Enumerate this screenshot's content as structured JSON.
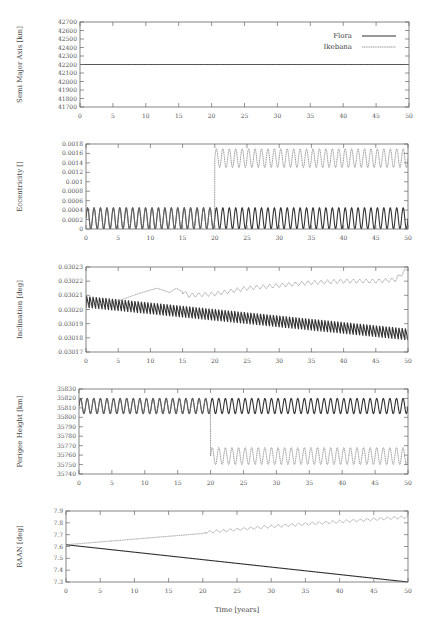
{
  "colors": {
    "flora": "#333333",
    "ikebana": "#888888",
    "axis": "#666666"
  },
  "legend": {
    "flora": "Flora",
    "ikebana": "Ikebana"
  },
  "chart_data": [
    {
      "type": "line",
      "id": "sma",
      "ylabel": "Semi Major Axis [km]",
      "xlabel": "",
      "xlim": [
        0,
        50
      ],
      "ylim": [
        41700,
        42700
      ],
      "xticks": [
        0,
        5,
        10,
        15,
        20,
        25,
        30,
        35,
        40,
        45,
        50
      ],
      "yticks": [
        41700,
        41800,
        41900,
        42000,
        42100,
        42200,
        42300,
        42400,
        42500,
        42600,
        42700
      ],
      "ytick_labels": [
        "41700",
        "41800",
        "41900",
        "42000",
        "42100",
        "42200",
        "42300",
        "42400",
        "42500",
        "42600",
        "42700"
      ],
      "legend_position": "upper right",
      "box": {
        "x0": 80,
        "x1": 409,
        "y0": 22,
        "y1": 107
      },
      "series": [
        {
          "name": "Flora",
          "style": "solid",
          "model": {
            "kind": "const",
            "value": 42200
          }
        },
        {
          "name": "Ikebana",
          "style": "dotted",
          "model": {
            "kind": "const",
            "value": 42200
          }
        }
      ]
    },
    {
      "type": "line",
      "id": "ecc",
      "ylabel": "Eccentricity []",
      "xlabel": "",
      "xlim": [
        0,
        50
      ],
      "ylim": [
        0,
        0.0018
      ],
      "xticks": [
        0,
        5,
        10,
        15,
        20,
        25,
        30,
        35,
        40,
        45,
        50
      ],
      "yticks": [
        0,
        0.0002,
        0.0004,
        0.0006,
        0.0008,
        0.001,
        0.0012,
        0.0014,
        0.0016,
        0.0018
      ],
      "ytick_labels": [
        "0",
        "0.0002",
        "0.0004",
        "0.0006",
        "0.0008",
        "0.001",
        "0.0012",
        "0.0014",
        "0.0016",
        "0.0018"
      ],
      "box": {
        "x0": 86,
        "x1": 408,
        "y0": 144,
        "y1": 229
      },
      "series": [
        {
          "name": "Flora",
          "style": "solid",
          "model": {
            "kind": "osc",
            "base": 0.000225,
            "amp": 0.000225,
            "period": 1.0,
            "trend": 0
          }
        },
        {
          "name": "Ikebana",
          "style": "dotted",
          "model": {
            "kind": "osc_step",
            "t_step": 20,
            "before": {
              "base": 0.000225,
              "amp": 0.000225
            },
            "after": {
              "base": 0.0015,
              "amp": 0.0002
            },
            "period": 1.0
          }
        }
      ]
    },
    {
      "type": "line",
      "id": "inc",
      "ylabel": "Inclination [deg]",
      "xlabel": "",
      "xlim": [
        0,
        50
      ],
      "ylim": [
        0.03017,
        0.03023
      ],
      "xticks": [
        0,
        5,
        10,
        15,
        20,
        25,
        30,
        35,
        40,
        45,
        50
      ],
      "yticks": [
        0.03017,
        0.03018,
        0.03019,
        0.0302,
        0.03021,
        0.03022,
        0.03023
      ],
      "ytick_labels": [
        "0.03017",
        "0.03018",
        "0.03019",
        "0.03020",
        "0.03021",
        "0.03022",
        "0.03023"
      ],
      "box": {
        "x0": 86,
        "x1": 408,
        "y0": 267,
        "y1": 352
      },
      "series": [
        {
          "name": "Flora",
          "style": "solid",
          "model": {
            "kind": "saw",
            "start": 0.030203,
            "end": 0.03018,
            "amp": 8.5e-06,
            "period": 0.5
          }
        },
        {
          "name": "Ikebana",
          "style": "dotted",
          "points": [
            [
              0,
              0.030203
            ],
            [
              5,
              0.030206
            ],
            [
              8,
              0.030211
            ],
            [
              11,
              0.030215
            ],
            [
              13,
              0.030212
            ],
            [
              14,
              0.030215
            ],
            [
              16,
              0.03021
            ],
            [
              20,
              0.030211
            ],
            [
              25,
              0.030215
            ],
            [
              30,
              0.030217
            ],
            [
              35,
              0.030219
            ],
            [
              40,
              0.03022
            ],
            [
              45,
              0.03022
            ],
            [
              48,
              0.030221
            ],
            [
              50,
              0.030229
            ]
          ],
          "wiggle": {
            "from": 15,
            "amp": 1.5e-06,
            "period": 1.0
          }
        }
      ]
    },
    {
      "type": "line",
      "id": "perigee",
      "ylabel": "Perigee Height [km]",
      "xlabel": "",
      "xlim": [
        0,
        50
      ],
      "ylim": [
        35740,
        35830
      ],
      "xticks": [
        0,
        5,
        10,
        15,
        20,
        25,
        30,
        35,
        40,
        45,
        50
      ],
      "yticks": [
        35740,
        35750,
        35760,
        35770,
        35780,
        35790,
        35800,
        35810,
        35820,
        35830
      ],
      "ytick_labels": [
        "35740",
        "35750",
        "35760",
        "35770",
        "35780",
        "35790",
        "35800",
        "35810",
        "35820",
        "35830"
      ],
      "box": {
        "x0": 79,
        "x1": 408,
        "y0": 389,
        "y1": 474
      },
      "series": [
        {
          "name": "Flora",
          "style": "solid",
          "model": {
            "kind": "osc",
            "base": 35812,
            "amp": 8,
            "period": 1.0,
            "trend": 0
          }
        },
        {
          "name": "Ikebana",
          "style": "dotted",
          "model": {
            "kind": "osc_step",
            "t_step": 20,
            "before": {
              "base": 35812,
              "amp": 8
            },
            "after": {
              "base": 35759,
              "amp": 9
            },
            "period": 1.0
          }
        }
      ]
    },
    {
      "type": "line",
      "id": "raan",
      "ylabel": "RAAN [deg]",
      "xlabel": "Time [years]",
      "xlim": [
        0,
        50
      ],
      "ylim": [
        7.3,
        7.9
      ],
      "xticks": [
        0,
        5,
        10,
        15,
        20,
        25,
        30,
        35,
        40,
        45,
        50
      ],
      "yticks": [
        7.3,
        7.4,
        7.5,
        7.6,
        7.7,
        7.8,
        7.9
      ],
      "ytick_labels": [
        "7.3",
        "7.4",
        "7.5",
        "7.6",
        "7.7",
        "7.8",
        "7.9"
      ],
      "box": {
        "x0": 66,
        "x1": 408,
        "y0": 511,
        "y1": 582
      },
      "series": [
        {
          "name": "Flora",
          "style": "solid",
          "points": [
            [
              0,
              7.615
            ],
            [
              50,
              7.3
            ]
          ]
        },
        {
          "name": "Ikebana",
          "style": "dotted",
          "points": [
            [
              0,
              7.615
            ],
            [
              20,
              7.71
            ],
            [
              20.5,
              7.72
            ],
            [
              30,
              7.77
            ],
            [
              40,
              7.81
            ],
            [
              50,
              7.85
            ]
          ],
          "wiggle": {
            "from": 20.5,
            "amp": 0.012,
            "period": 1.0
          }
        }
      ]
    }
  ]
}
